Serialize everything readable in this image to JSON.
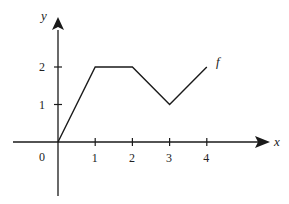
{
  "chart_data": {
    "type": "line",
    "title": "",
    "xlabel": "x",
    "ylabel": "y",
    "series": [
      {
        "name": "f",
        "x": [
          0,
          1,
          2,
          3,
          4
        ],
        "values": [
          0,
          2,
          2,
          1,
          2
        ]
      }
    ],
    "x_ticks": [
      "0",
      "1",
      "2",
      "3",
      "4"
    ],
    "y_ticks": [
      "1",
      "2"
    ],
    "xlim": [
      -1.2,
      5.7
    ],
    "ylim": [
      -1.4,
      3.4
    ],
    "grid": false,
    "legend": "inline label 'f' at end of curve"
  },
  "labels": {
    "origin": "0",
    "x_axis": "x",
    "y_axis": "y",
    "curve": "f"
  },
  "colors": {
    "line": "#1a1a1a",
    "background": "#ffffff"
  }
}
